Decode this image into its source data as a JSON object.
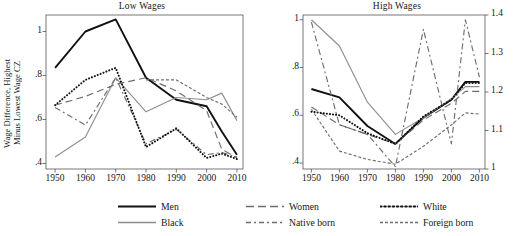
{
  "figure": {
    "ylabel_line1": "Wage Difference, Highest",
    "ylabel_line2": "Minus Lowest Wage CZ"
  },
  "panels": [
    {
      "key": "low",
      "title": "Low Wages"
    },
    {
      "key": "high",
      "title": "High Wages"
    }
  ],
  "legend": {
    "items": [
      {
        "label": "Men",
        "style": "solid-black",
        "color": "#111111"
      },
      {
        "label": "Black",
        "style": "solid-gray",
        "color": "#8c8c8c"
      },
      {
        "label": "Women",
        "style": "long-dash",
        "color": "#6e6e6e"
      },
      {
        "label": "Native born",
        "style": "dash-dot",
        "color": "#6e6e6e"
      },
      {
        "label": "White",
        "style": "dotted",
        "color": "#111111"
      },
      {
        "label": "Foreign born",
        "style": "short-dash",
        "color": "#6e6e6e"
      }
    ]
  },
  "chart_data": [
    {
      "type": "line",
      "title": "Low Wages",
      "xlabel": "",
      "ylabel": "Wage Difference, Highest Minus Lowest Wage CZ",
      "x": [
        1950,
        1960,
        1970,
        1980,
        1990,
        2000,
        2005,
        2010
      ],
      "xlim": [
        1947,
        2012
      ],
      "ylim": [
        0.375,
        1.075
      ],
      "yticks": [
        0.4,
        0.6,
        0.8,
        1.0
      ],
      "yticklabels": [
        ".4",
        ".6",
        ".8",
        "1"
      ],
      "xticks": [
        1950,
        1960,
        1970,
        1980,
        1990,
        2000,
        2010
      ],
      "xticklabels": [
        "1950",
        "1960",
        "1970",
        "1980",
        "1990",
        "2000",
        "2010"
      ],
      "grid": false,
      "legend_position": "below-figure",
      "series": [
        {
          "name": "Men",
          "style": "solid-black",
          "values": [
            0.835,
            1.0,
            1.055,
            0.79,
            0.69,
            0.66,
            0.545,
            0.44
          ]
        },
        {
          "name": "Black",
          "style": "solid-gray",
          "values": [
            0.43,
            0.52,
            0.79,
            0.635,
            0.7,
            0.69,
            0.72,
            0.595
          ]
        },
        {
          "name": "Women",
          "style": "long-dash",
          "values": [
            0.665,
            0.705,
            0.76,
            0.79,
            0.73,
            0.64,
            0.465,
            0.425
          ]
        },
        {
          "name": "Native born",
          "style": "dash-dot",
          "values": [
            0.655,
            0.575,
            0.79,
            0.49,
            0.555,
            0.44,
            0.45,
            0.43
          ]
        },
        {
          "name": "White",
          "style": "dotted",
          "values": [
            0.665,
            0.78,
            0.835,
            0.475,
            0.56,
            0.425,
            0.445,
            0.42
          ]
        },
        {
          "name": "Foreign born",
          "style": "short-dash",
          "values": [
            null,
            null,
            null,
            0.78,
            0.78,
            0.7,
            0.67,
            0.61
          ]
        }
      ]
    },
    {
      "type": "line",
      "title": "High Wages",
      "xlabel": "",
      "ylabel": "",
      "x": [
        1950,
        1960,
        1970,
        1980,
        1990,
        2000,
        2005,
        2010
      ],
      "xlim": [
        1947,
        2012
      ],
      "ylim": [
        0.375,
        1.02
      ],
      "yticks_left": [
        0.4,
        0.6,
        0.8,
        1.0
      ],
      "yticklabels_left": [
        ".4",
        ".6",
        ".8",
        "1"
      ],
      "yticks_right": [
        1.0,
        1.1,
        1.2,
        1.3,
        1.4
      ],
      "yticklabels_right": [
        "1",
        "1.1",
        "1.2",
        "1.3",
        "1.4"
      ],
      "xticks": [
        1950,
        1960,
        1970,
        1980,
        1990,
        2000,
        2010
      ],
      "xticklabels": [
        "1950",
        "1960",
        "1970",
        "1980",
        "1990",
        "2000",
        "2010"
      ],
      "grid": false,
      "legend_position": "below-figure",
      "series": [
        {
          "name": "Men",
          "style": "solid-black",
          "values": [
            0.71,
            0.675,
            0.555,
            0.48,
            0.59,
            0.665,
            0.74,
            0.74
          ]
        },
        {
          "name": "Black",
          "style": "solid-gray",
          "values": [
            1.0,
            0.89,
            0.655,
            0.52,
            0.59,
            0.67,
            0.72,
            0.72
          ]
        },
        {
          "name": "Women",
          "style": "long-dash",
          "values": [
            0.635,
            0.56,
            0.52,
            0.48,
            0.58,
            0.65,
            0.7,
            0.7
          ]
        },
        {
          "name": "Native born",
          "style": "dash-dot",
          "values": [
            0.99,
            0.56,
            0.52,
            0.385,
            0.96,
            0.48,
            1.0,
            0.76
          ]
        },
        {
          "name": "White",
          "style": "dotted",
          "values": [
            0.615,
            0.6,
            0.525,
            0.48,
            0.595,
            0.665,
            0.735,
            0.735
          ]
        },
        {
          "name": "Foreign born",
          "style": "short-dash",
          "values": [
            0.625,
            0.45,
            0.415,
            0.395,
            0.47,
            0.56,
            0.61,
            0.605
          ]
        }
      ]
    }
  ]
}
